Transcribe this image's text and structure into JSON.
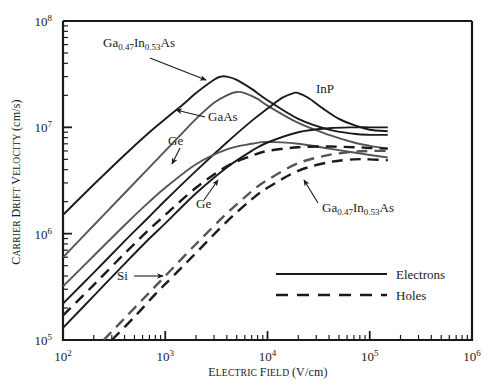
{
  "figure": {
    "background": "#ffffff",
    "frame_color": "#1a1a1a"
  },
  "axes": {
    "x": {
      "label_parts": {
        "word1_cap": "E",
        "word1_rest": "LECTRIC",
        "word2_cap": "F",
        "word2_rest": "IELD",
        "units": "(V/cm)"
      },
      "label_full": "ELECTRIC FIELD (V/cm)",
      "scale": "log",
      "min": 100,
      "max": 1000000,
      "ticks": [
        {
          "value": 100,
          "mantissa": "10",
          "exponent": "2"
        },
        {
          "value": 1000,
          "mantissa": "10",
          "exponent": "3"
        },
        {
          "value": 10000,
          "mantissa": "10",
          "exponent": "4"
        },
        {
          "value": 100000,
          "mantissa": "10",
          "exponent": "5"
        },
        {
          "value": 1000000,
          "mantissa": "10",
          "exponent": "6"
        }
      ]
    },
    "y": {
      "label_parts": {
        "word1_cap": "C",
        "word1_rest": "ARRIER",
        "word2_cap": "D",
        "word2_rest": "RIFT",
        "word3_cap": "V",
        "word3_rest": "ELOCITY",
        "units": "(cm/s)"
      },
      "label_full": "CARRIER DRIFT VELOCITY (cm/s)",
      "scale": "log",
      "min": 100000,
      "max": 100000000,
      "ticks": [
        {
          "value": 100000,
          "mantissa": "10",
          "exponent": "5"
        },
        {
          "value": 1000000,
          "mantissa": "10",
          "exponent": "6"
        },
        {
          "value": 10000000,
          "mantissa": "10",
          "exponent": "7"
        },
        {
          "value": 100000000,
          "mantissa": "10",
          "exponent": "8"
        }
      ]
    }
  },
  "legend": {
    "position": "bottom-right-inside",
    "entries": [
      {
        "label": "Electrons",
        "style": "solid"
      },
      {
        "label": "Holes",
        "style": "dashed"
      }
    ]
  },
  "annotations": [
    {
      "id": "gainas-electrons",
      "text_parts": {
        "a": "Ga",
        "sub1": "0.47",
        "b": "In",
        "sub2": "0.53",
        "c": "As"
      },
      "text_full": "Ga0.47In0.53As",
      "x": 103,
      "y": 47,
      "arrow_from": [
        150,
        58
      ],
      "arrow_to": [
        206,
        80
      ]
    },
    {
      "id": "gaas-electrons",
      "text_parts": {
        "a": "GaAs"
      },
      "text_full": "GaAs",
      "x": 208,
      "y": 121,
      "arrow_from": [
        205,
        117
      ],
      "arrow_to": [
        176,
        110
      ]
    },
    {
      "id": "ge-electrons",
      "text_parts": {
        "a": "Ge"
      },
      "text_full": "Ge",
      "x": 168,
      "y": 145,
      "arrow_from": [
        180,
        148
      ],
      "arrow_to": [
        172,
        164
      ]
    },
    {
      "id": "inp-electrons",
      "text_parts": {
        "a": "InP"
      },
      "text_full": "InP",
      "x": 316,
      "y": 93,
      "arrow_from": null,
      "arrow_to": null
    },
    {
      "id": "si-electrons",
      "text_parts": {
        "a": "Si"
      },
      "text_full": "Si",
      "x": 117,
      "y": 280,
      "arrow_from": [
        134,
        276
      ],
      "arrow_to": [
        163,
        276
      ]
    },
    {
      "id": "ge-holes",
      "text_parts": {
        "a": "Ge"
      },
      "text_full": "Ge",
      "x": 196,
      "y": 208,
      "arrow_from": [
        204,
        200
      ],
      "arrow_to": [
        218,
        180
      ]
    },
    {
      "id": "gainas-holes",
      "text_parts": {
        "a": "Ga",
        "sub1": "0.47",
        "b": "In",
        "sub2": "0.53",
        "c": "As"
      },
      "text_full": "Ga0.47In0.53As",
      "x": 322,
      "y": 212,
      "arrow_from": [
        318,
        203
      ],
      "arrow_to": [
        304,
        180
      ]
    }
  ],
  "chart_data": {
    "type": "line",
    "title": "",
    "subtitle": "",
    "xlabel": "ELECTRIC FIELD (V/cm)",
    "ylabel": "CARRIER DRIFT VELOCITY (cm/s)",
    "xscale": "log",
    "yscale": "log",
    "xlim": [
      100,
      1000000
    ],
    "ylim": [
      100000,
      100000000
    ],
    "grid": false,
    "legend_position": "lower right",
    "legend_entries": [
      "Electrons",
      "Holes"
    ],
    "series": [
      {
        "name": "Ga0.47In0.53As electrons",
        "carrier": "electrons",
        "style": "solid",
        "color": "#1a1a1a",
        "points": [
          [
            100,
            1500000
          ],
          [
            200,
            2900000
          ],
          [
            400,
            5500000
          ],
          [
            700,
            9000000
          ],
          [
            1000,
            12000000
          ],
          [
            1500,
            16500000
          ],
          [
            2000,
            21000000
          ],
          [
            3000,
            28000000
          ],
          [
            3500,
            30000000
          ],
          [
            4000,
            30000000
          ],
          [
            5000,
            28000000
          ],
          [
            7000,
            23000000
          ],
          [
            10000,
            18000000
          ],
          [
            20000,
            12000000
          ],
          [
            40000,
            9500000
          ],
          [
            70000,
            8700000
          ],
          [
            100000,
            8500000
          ],
          [
            150000,
            8500000
          ]
        ]
      },
      {
        "name": "GaAs electrons",
        "carrier": "electrons",
        "style": "solid",
        "color": "#555555",
        "points": [
          [
            100,
            600000
          ],
          [
            200,
            1200000
          ],
          [
            400,
            2400000
          ],
          [
            700,
            4200000
          ],
          [
            1000,
            6000000
          ],
          [
            1500,
            9000000
          ],
          [
            2000,
            12000000
          ],
          [
            3000,
            17000000
          ],
          [
            4000,
            20000000
          ],
          [
            5000,
            21500000
          ],
          [
            6000,
            21000000
          ],
          [
            8000,
            18500000
          ],
          [
            10000,
            16000000
          ],
          [
            20000,
            11000000
          ],
          [
            40000,
            8500000
          ],
          [
            70000,
            7200000
          ],
          [
            100000,
            6700000
          ],
          [
            150000,
            6300000
          ]
        ]
      },
      {
        "name": "InP electrons",
        "carrier": "electrons",
        "style": "solid",
        "color": "#1a1a1a",
        "points": [
          [
            100,
            220000
          ],
          [
            200,
            430000
          ],
          [
            400,
            850000
          ],
          [
            700,
            1450000
          ],
          [
            1000,
            2050000
          ],
          [
            2000,
            3900000
          ],
          [
            4000,
            7200000
          ],
          [
            7000,
            11500000
          ],
          [
            10000,
            15000000
          ],
          [
            14000,
            19000000
          ],
          [
            18000,
            21000000
          ],
          [
            20000,
            21000000
          ],
          [
            25000,
            19000000
          ],
          [
            35000,
            15000000
          ],
          [
            50000,
            12000000
          ],
          [
            70000,
            10500000
          ],
          [
            100000,
            9500000
          ],
          [
            150000,
            9200000
          ]
        ]
      },
      {
        "name": "Ge electrons",
        "carrier": "electrons",
        "style": "solid",
        "color": "#555555",
        "points": [
          [
            100,
            320000
          ],
          [
            200,
            620000
          ],
          [
            400,
            1200000
          ],
          [
            700,
            2000000
          ],
          [
            1000,
            2700000
          ],
          [
            2000,
            4500000
          ],
          [
            4000,
            6200000
          ],
          [
            7000,
            7000000
          ],
          [
            10000,
            7300000
          ],
          [
            20000,
            7000000
          ],
          [
            40000,
            6300000
          ],
          [
            70000,
            5800000
          ],
          [
            100000,
            5500000
          ],
          [
            150000,
            5200000
          ]
        ]
      },
      {
        "name": "Si electrons",
        "carrier": "electrons",
        "style": "solid",
        "color": "#1a1a1a",
        "points": [
          [
            100,
            130000
          ],
          [
            200,
            260000
          ],
          [
            400,
            520000
          ],
          [
            700,
            900000
          ],
          [
            1000,
            1250000
          ],
          [
            2000,
            2400000
          ],
          [
            4000,
            4200000
          ],
          [
            7000,
            6000000
          ],
          [
            10000,
            7200000
          ],
          [
            20000,
            9000000
          ],
          [
            40000,
            9800000
          ],
          [
            70000,
            10000000
          ],
          [
            100000,
            10000000
          ],
          [
            150000,
            10000000
          ]
        ]
      },
      {
        "name": "Ge holes",
        "carrier": "holes",
        "style": "dashed",
        "color": "#1a1a1a",
        "points": [
          [
            100,
            170000
          ],
          [
            200,
            330000
          ],
          [
            400,
            650000
          ],
          [
            700,
            1100000
          ],
          [
            1000,
            1500000
          ],
          [
            2000,
            2700000
          ],
          [
            4000,
            4300000
          ],
          [
            7000,
            5400000
          ],
          [
            10000,
            6000000
          ],
          [
            20000,
            6500000
          ],
          [
            40000,
            6600000
          ],
          [
            70000,
            6500000
          ],
          [
            100000,
            6400000
          ],
          [
            150000,
            6300000
          ]
        ]
      },
      {
        "name": "Si holes",
        "carrier": "holes",
        "style": "dashed",
        "color": "#555555",
        "points": [
          [
            250,
            100000
          ],
          [
            400,
            160000
          ],
          [
            700,
            280000
          ],
          [
            1000,
            400000
          ],
          [
            2000,
            800000
          ],
          [
            4000,
            1550000
          ],
          [
            7000,
            2500000
          ],
          [
            10000,
            3200000
          ],
          [
            20000,
            4600000
          ],
          [
            40000,
            5500000
          ],
          [
            70000,
            5900000
          ],
          [
            100000,
            6000000
          ],
          [
            150000,
            6000000
          ]
        ]
      },
      {
        "name": "Ga0.47In0.53As holes",
        "carrier": "holes",
        "style": "dashed",
        "color": "#1a1a1a",
        "points": [
          [
            300,
            100000
          ],
          [
            500,
            165000
          ],
          [
            800,
            270000
          ],
          [
            1200,
            400000
          ],
          [
            2000,
            660000
          ],
          [
            4000,
            1300000
          ],
          [
            7000,
            2100000
          ],
          [
            10000,
            2700000
          ],
          [
            20000,
            3900000
          ],
          [
            40000,
            4700000
          ],
          [
            70000,
            5000000
          ],
          [
            100000,
            5000000
          ],
          [
            150000,
            4900000
          ]
        ]
      }
    ]
  }
}
